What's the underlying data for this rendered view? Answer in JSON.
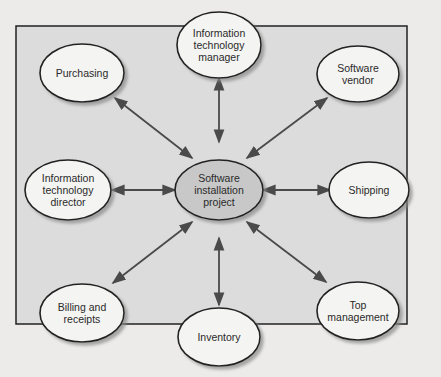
{
  "diagram": {
    "type": "hub-and-spoke",
    "center": {
      "label": "Software installation project",
      "lines": [
        "Software",
        "installation",
        "project"
      ]
    },
    "nodes": [
      {
        "id": "it-manager",
        "lines": [
          "Information",
          "technology",
          "manager"
        ]
      },
      {
        "id": "purchasing",
        "lines": [
          "Purchasing"
        ]
      },
      {
        "id": "software-vendor",
        "lines": [
          "Software",
          "vendor"
        ]
      },
      {
        "id": "it-director",
        "lines": [
          "Information",
          "technology",
          "director"
        ]
      },
      {
        "id": "shipping",
        "lines": [
          "Shipping"
        ]
      },
      {
        "id": "billing",
        "lines": [
          "Billing and",
          "receipts"
        ]
      },
      {
        "id": "top-management",
        "lines": [
          "Top",
          "management"
        ]
      },
      {
        "id": "inventory",
        "lines": [
          "Inventory"
        ]
      }
    ],
    "edges": "bidirectional arrows from center to each node",
    "colors": {
      "panel": "#dcdcdc",
      "center_fill": "#c8c8c8",
      "node_fill": "#f4f4f2",
      "stroke": "#222222",
      "arrow": "#555555"
    }
  }
}
